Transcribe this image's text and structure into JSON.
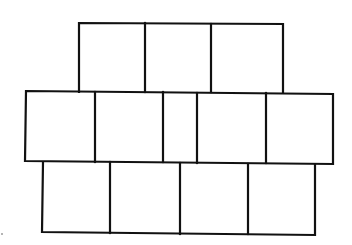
{
  "diagram": {
    "line_color": "#111111",
    "background": "#ffffff",
    "rows": [
      {
        "name": "top-row",
        "block_count": 3,
        "x": 79,
        "y": 23,
        "width": 204,
        "height": 69,
        "dividers_x": [
          145,
          211
        ]
      },
      {
        "name": "middle-row",
        "block_count": 5,
        "x": 26,
        "y": 92,
        "width": 307,
        "height": 71,
        "dividers_x": [
          95,
          163,
          197,
          266
        ]
      },
      {
        "name": "bottom-row",
        "block_count": 4,
        "x": 42,
        "y": 163,
        "width": 273,
        "height": 71,
        "dividers_x": [
          110,
          180,
          248
        ]
      }
    ]
  }
}
